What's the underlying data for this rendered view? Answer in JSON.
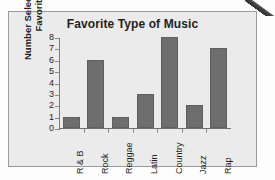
{
  "chart_data": {
    "type": "bar",
    "title": "Favorite Type of Music",
    "xlabel": "",
    "ylabel": "Number Selecting as Favorite",
    "categories": [
      "R & B",
      "Rock",
      "Reggae",
      "Latin",
      "Country",
      "Jazz",
      "Rap"
    ],
    "values": [
      1,
      6,
      1,
      3,
      8,
      2,
      7
    ],
    "ylim": [
      0,
      8
    ],
    "ytick_labels": [
      "0",
      "1",
      "2",
      "3",
      "4",
      "5",
      "6",
      "7",
      "8"
    ],
    "grid": false,
    "legend": "none",
    "bar_color": "#6e6e6e",
    "panel_background": "#ebebeb",
    "panel_border_color": "#9a9a9a",
    "axis_color": "#7d7d7d",
    "text_color": "#1f1f1f"
  }
}
